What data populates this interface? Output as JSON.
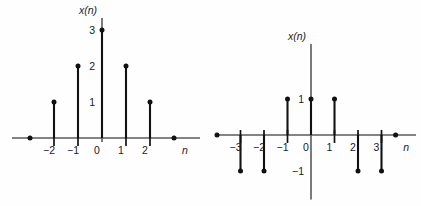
{
  "figure": {
    "background": "#fefefe",
    "ink_color": "#111111",
    "axis_color": "#5a5a5a"
  },
  "chart_data": [
    {
      "type": "stem",
      "id": "left-stem-plot",
      "title": "",
      "xlabel": "n",
      "ylabel": "x(n)",
      "signal_label": "x(n)",
      "x": [
        -2,
        -1,
        0,
        1,
        2
      ],
      "values": [
        1,
        2,
        3,
        2,
        1
      ],
      "xtick_labels": [
        "−2",
        "−1",
        "0",
        "1",
        "2"
      ],
      "ytick_labels": [
        "1",
        "2",
        "3"
      ],
      "ytick_values": [
        1,
        2,
        3
      ],
      "xlim": [
        -3.0,
        3.2
      ],
      "ylim": [
        0,
        3.3
      ],
      "grid": false,
      "zero_samples_shown": [
        -3,
        3
      ],
      "geometry": {
        "origin_x": 102,
        "baseline_y": 138,
        "unit_x": 24.0,
        "unit_y": 36.0,
        "axis_start_x": 12,
        "axis_end_x": 200,
        "yaxis_top_y": 18
      }
    },
    {
      "type": "stem",
      "id": "right-stem-plot",
      "title": "",
      "xlabel": "n",
      "ylabel": "x(n)",
      "signal_label": "x(n)",
      "x": [
        -3,
        -2,
        -1,
        0,
        1,
        2,
        3
      ],
      "values": [
        -1,
        -1,
        1,
        1,
        1,
        -1,
        -1
      ],
      "xtick_labels": [
        "−3",
        "−2",
        "−1",
        "0",
        "1",
        "2",
        "3"
      ],
      "ytick_labels": [
        "1",
        "−1"
      ],
      "ytick_values": [
        1,
        -1
      ],
      "xlim": [
        -4.2,
        4.0
      ],
      "ylim": [
        -1.4,
        1.6
      ],
      "grid": false,
      "zero_samples_shown": [
        -4,
        3.6
      ],
      "geometry": {
        "origin_x": 311,
        "baseline_y": 135,
        "unit_x": 23.5,
        "unit_y": 36.0,
        "axis_start_x": 215,
        "axis_end_x": 416,
        "yaxis_top_y": 44
      }
    }
  ]
}
